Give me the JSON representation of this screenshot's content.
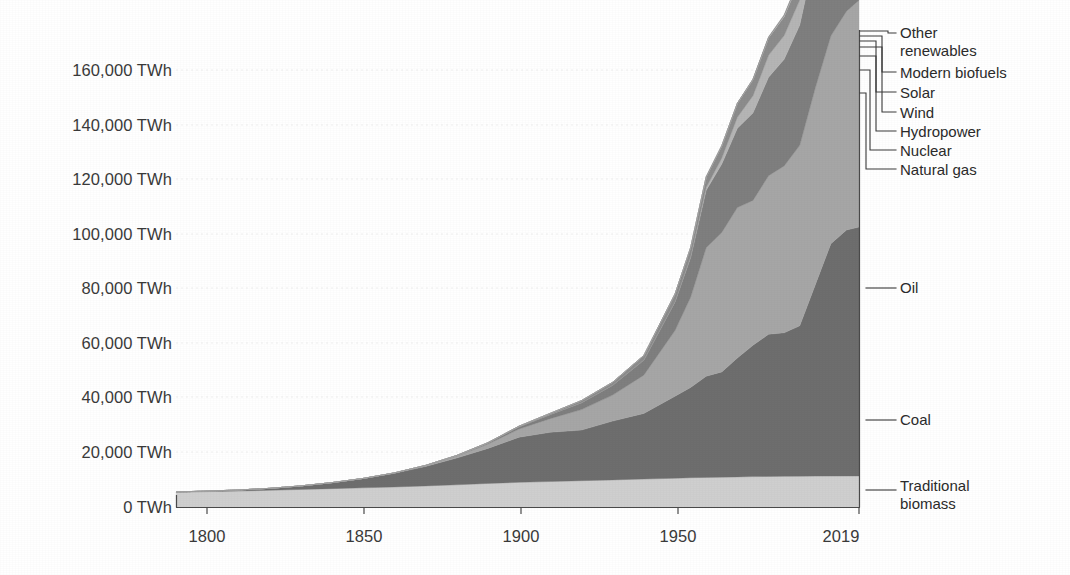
{
  "chart_data": {
    "type": "area",
    "title": "",
    "subtitle": "",
    "xlabel": "",
    "ylabel": "",
    "stacked": true,
    "grid": true,
    "legend_position": "right-inline-leader-lines",
    "xlim": [
      1800,
      2019
    ],
    "ylim": [
      0,
      170000
    ],
    "y_unit": "TWh",
    "x_tick_labels": [
      "1800",
      "1850",
      "1900",
      "1950",
      "2019"
    ],
    "x_ticks": [
      1800,
      1850,
      1900,
      1950,
      2019
    ],
    "y_tick_labels": [
      "0 TWh",
      "20,000 TWh",
      "40,000 TWh",
      "60,000 TWh",
      "80,000 TWh",
      "100,000 TWh",
      "120,000 TWh",
      "140,000 TWh",
      "160,000 TWh"
    ],
    "y_ticks": [
      0,
      20000,
      40000,
      60000,
      80000,
      100000,
      120000,
      140000,
      160000
    ],
    "x": [
      1800,
      1810,
      1820,
      1830,
      1840,
      1850,
      1860,
      1870,
      1880,
      1890,
      1900,
      1910,
      1920,
      1930,
      1940,
      1950,
      1960,
      1965,
      1970,
      1975,
      1980,
      1985,
      1990,
      1995,
      2000,
      2005,
      2010,
      2015,
      2019
    ],
    "series": [
      {
        "name": "Traditional biomass",
        "color": "#cfcfcf",
        "values": [
          5600,
          5800,
          6000,
          6300,
          6600,
          6900,
          7200,
          7500,
          7900,
          8300,
          8800,
          9200,
          9500,
          9800,
          10100,
          10400,
          10700,
          10900,
          11000,
          11100,
          11200,
          11300,
          11350,
          11400,
          11450,
          11480,
          11500,
          11520,
          11540
        ]
      },
      {
        "name": "Coal",
        "color": "#6e6e6e",
        "values": [
          100,
          200,
          400,
          700,
          1300,
          2200,
          3400,
          5000,
          7100,
          9800,
          12800,
          16500,
          18000,
          18500,
          21500,
          24000,
          30000,
          33000,
          37000,
          38500,
          43500,
          48000,
          52000,
          52500,
          55000,
          70000,
          85000,
          90000,
          91000
        ]
      },
      {
        "name": "Oil",
        "color": "#a6a6a6",
        "values": [
          0,
          0,
          0,
          0,
          0,
          0,
          30,
          120,
          300,
          700,
          1600,
          3000,
          5000,
          7500,
          9500,
          14000,
          24000,
          33000,
          47000,
          51000,
          55000,
          53000,
          58000,
          61000,
          66000,
          72000,
          76000,
          80000,
          83000
        ]
      },
      {
        "name": "Natural gas",
        "color": "#7f7f7f",
        "values": [
          0,
          0,
          0,
          0,
          0,
          0,
          0,
          30,
          80,
          200,
          400,
          800,
          1500,
          2500,
          3600,
          5500,
          10500,
          14500,
          21000,
          25000,
          29000,
          32000,
          36000,
          39000,
          44000,
          49000,
          56000,
          60000,
          65000
        ]
      },
      {
        "name": "Nuclear",
        "color": "#b5b5b5",
        "values": [
          0,
          0,
          0,
          0,
          0,
          0,
          0,
          0,
          0,
          0,
          0,
          0,
          0,
          0,
          0,
          0,
          80,
          300,
          1000,
          2200,
          4000,
          6300,
          8000,
          8700,
          9200,
          9400,
          9100,
          8400,
          8700
        ]
      },
      {
        "name": "Hydropower",
        "color": "#8c8c8c",
        "values": [
          0,
          0,
          0,
          0,
          0,
          0,
          0,
          0,
          10,
          30,
          100,
          250,
          450,
          800,
          1100,
          1700,
          2800,
          3300,
          3900,
          4500,
          5100,
          5900,
          6400,
          7000,
          7400,
          7900,
          9000,
          9700,
          10200
        ]
      },
      {
        "name": "Wind",
        "color": "#c4c4c4",
        "values": [
          0,
          0,
          0,
          0,
          0,
          0,
          0,
          0,
          0,
          0,
          0,
          0,
          0,
          0,
          0,
          0,
          0,
          0,
          0,
          0,
          0,
          0,
          10,
          20,
          80,
          250,
          900,
          2100,
          3600
        ]
      },
      {
        "name": "Solar",
        "color": "#9a9a9a",
        "values": [
          0,
          0,
          0,
          0,
          0,
          0,
          0,
          0,
          0,
          0,
          0,
          0,
          0,
          0,
          0,
          0,
          0,
          0,
          0,
          0,
          0,
          0,
          0,
          0,
          5,
          10,
          90,
          700,
          1900
        ]
      },
      {
        "name": "Modern biofuels",
        "color": "#bfbfbf",
        "values": [
          0,
          0,
          0,
          0,
          0,
          0,
          0,
          0,
          0,
          0,
          0,
          0,
          0,
          0,
          0,
          0,
          0,
          0,
          0,
          0,
          30,
          80,
          150,
          250,
          400,
          650,
          900,
          1050,
          1150
        ]
      },
      {
        "name": "Other renewables",
        "color": "#8f8f8f",
        "values": [
          0,
          0,
          0,
          0,
          0,
          0,
          0,
          0,
          0,
          0,
          0,
          0,
          0,
          0,
          0,
          0,
          0,
          0,
          20,
          40,
          80,
          140,
          250,
          380,
          500,
          700,
          950,
          1300,
          1700
        ]
      }
    ],
    "legend": [
      {
        "label": "Other\nrenewables",
        "series": "Other renewables"
      },
      {
        "label": "Modern biofuels",
        "series": "Modern biofuels"
      },
      {
        "label": "Solar",
        "series": "Solar"
      },
      {
        "label": "Wind",
        "series": "Wind"
      },
      {
        "label": "Hydropower",
        "series": "Hydropower"
      },
      {
        "label": "Nuclear",
        "series": "Nuclear"
      },
      {
        "label": "Natural gas",
        "series": "Natural gas"
      },
      {
        "label": "Oil",
        "series": "Oil"
      },
      {
        "label": "Coal",
        "series": "Coal"
      },
      {
        "label": "Traditional\nbiomass",
        "series": "Traditional biomass"
      }
    ]
  },
  "axes": {
    "y_labels": [
      "160,000 TWh",
      "140,000 TWh",
      "120,000 TWh",
      "100,000 TWh",
      "80,000 TWh",
      "60,000 TWh",
      "40,000 TWh",
      "20,000 TWh",
      "0 TWh"
    ],
    "x_labels": [
      "1800",
      "1850",
      "1900",
      "1950",
      "2019"
    ]
  },
  "legend_text": {
    "other_renewables": "Other\nrenewables",
    "modern_biofuels": "Modern biofuels",
    "solar": "Solar",
    "wind": "Wind",
    "hydropower": "Hydropower",
    "nuclear": "Nuclear",
    "natural_gas": "Natural gas",
    "oil": "Oil",
    "coal": "Coal",
    "traditional_biomass": "Traditional\nbiomass"
  },
  "colors": {
    "axis": "#5a5a5a",
    "text": "#2b2b2b",
    "grid": "#ededed",
    "background": "#ffffff"
  }
}
